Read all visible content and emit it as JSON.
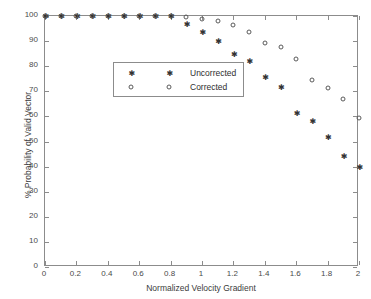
{
  "chart_data": {
    "type": "scatter",
    "title": "",
    "xlabel": "Normalized Velocity Gradient",
    "ylabel": "% Probability of Valid Vector",
    "xlim": [
      0,
      2
    ],
    "ylim": [
      0,
      100
    ],
    "xticks": [
      0,
      0.2,
      0.4,
      0.6,
      0.8,
      1,
      1.2,
      1.4,
      1.6,
      1.8,
      2
    ],
    "xticklabels": [
      "0",
      "0.2",
      "0.4",
      "0.6",
      "0.8",
      "1",
      "1.2",
      "1.4",
      "1.6",
      "1.8",
      "2"
    ],
    "yticks": [
      0,
      10,
      20,
      30,
      40,
      50,
      60,
      70,
      80,
      90,
      100
    ],
    "yticklabels": [
      "0",
      "10",
      "20",
      "30",
      "40",
      "50",
      "60",
      "70",
      "80",
      "90",
      "100"
    ],
    "grid": false,
    "legend_position": "upper-left-inset",
    "series": [
      {
        "name": "Uncorrected",
        "marker": "star",
        "color": "#333333",
        "x": [
          0.0,
          0.1,
          0.2,
          0.3,
          0.4,
          0.5,
          0.6,
          0.7,
          0.8,
          0.9,
          1.0,
          1.1,
          1.2,
          1.3,
          1.4,
          1.5,
          1.6,
          1.7,
          1.8,
          1.9,
          2.0
        ],
        "y": [
          100,
          100,
          100,
          100,
          100,
          100,
          100,
          100,
          100,
          97.0,
          93.5,
          90.2,
          84.7,
          82.1,
          75.8,
          71.6,
          61.3,
          58.1,
          51.7,
          44.2,
          40.0
        ]
      },
      {
        "name": "Corrected",
        "marker": "circle",
        "color": "#5a5a5a",
        "x": [
          0.0,
          0.1,
          0.2,
          0.3,
          0.4,
          0.5,
          0.6,
          0.7,
          0.8,
          0.9,
          1.0,
          1.1,
          1.2,
          1.3,
          1.4,
          1.5,
          1.6,
          1.7,
          1.8,
          1.9,
          2.0
        ],
        "y": [
          100,
          100,
          100,
          100,
          100,
          100,
          100,
          100,
          100,
          99.7,
          99.0,
          98.0,
          96.5,
          93.8,
          89.3,
          87.6,
          83.0,
          74.4,
          71.2,
          67.0,
          59.3
        ]
      }
    ]
  },
  "legend": {
    "entries": [
      {
        "label": "Uncorrected",
        "marker": "star"
      },
      {
        "label": "Corrected",
        "marker": "circle"
      }
    ]
  },
  "axes": {
    "x_title": "Normalized Velocity Gradient",
    "y_title": "% Probability of Valid Vector"
  }
}
